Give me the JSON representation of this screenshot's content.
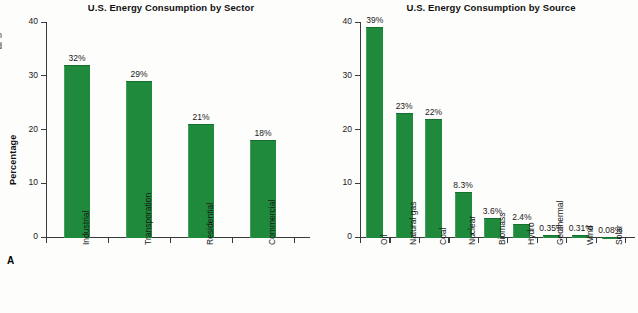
{
  "figure": {
    "background_color": "#fdfdfc",
    "bar_color": "#1f8a3c",
    "axis_color": "#3a3a3a",
    "margin_text_fragment": "n\nd"
  },
  "panels": [
    {
      "key": "A",
      "label": "A",
      "title": "U.S. Energy Consumption by Sector",
      "ylabel": "Percentage"
    },
    {
      "key": "B",
      "label": "B",
      "title": "U.S. Energy Consumption by Source",
      "ylabel": "Percentage"
    }
  ],
  "chart_data": [
    {
      "type": "bar",
      "panel": "A",
      "title": "U.S. Energy Consumption by Sector",
      "xlabel": "",
      "ylabel": "Percentage",
      "ylim": [
        0,
        40
      ],
      "yticks": [
        0,
        10,
        20,
        30,
        40
      ],
      "ytick_labels": [
        "0",
        "10",
        "20",
        "30",
        "40"
      ],
      "grid": false,
      "legend": "none",
      "categories": [
        "Industrial",
        "Transporation",
        "Residential",
        "Commercial"
      ],
      "values": [
        32,
        29,
        21,
        18
      ],
      "value_labels": [
        "32%",
        "29%",
        "21%",
        "18%"
      ]
    },
    {
      "type": "bar",
      "panel": "B",
      "title": "U.S. Energy Consumption by Source",
      "xlabel": "",
      "ylabel": "Percentage",
      "ylim": [
        0,
        40
      ],
      "yticks": [
        0,
        10,
        20,
        30,
        40
      ],
      "ytick_labels": [
        "0",
        "10",
        "20",
        "30",
        "40"
      ],
      "grid": false,
      "legend": "none",
      "categories": [
        "Oil",
        "Natural gas",
        "Coal",
        "Nuclear",
        "Biomass",
        "Hydro",
        "Geothermal",
        "Wind",
        "Solar"
      ],
      "values": [
        39,
        23,
        22,
        8.3,
        3.6,
        2.4,
        0.35,
        0.31,
        0.08
      ],
      "value_labels": [
        "39%",
        "23%",
        "22%",
        "8.3%",
        "3.6%",
        "2.4%",
        "0.35%",
        "0.31%",
        "0.08%"
      ]
    }
  ]
}
